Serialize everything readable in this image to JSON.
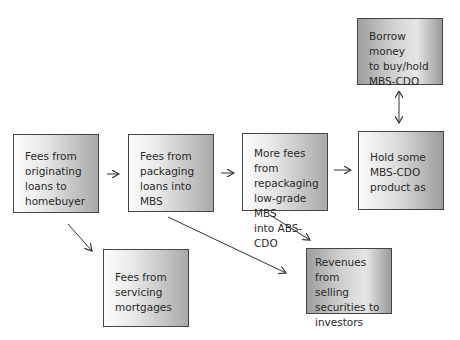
{
  "boxes": {
    "originating": "Fees from\noriginating\nloans to\nhomebuyer",
    "packaging": "Fees from\npackaging\nloans into MBS",
    "repackaging": "More fees from\nrepackaging\nlow-grade MBS\ninto ABS-CDO",
    "hold": "Hold some\nMBS-CDO\nproduct as",
    "borrow": "Borrow money\nto buy/hold\nMBS-CDO",
    "servicing": "Fees from\nservicing\nmortgages",
    "revenues": "Revenues from\nselling\nsecurities to\ninvestors"
  },
  "colors": {
    "border": "#444444",
    "arrow": "#333333"
  }
}
